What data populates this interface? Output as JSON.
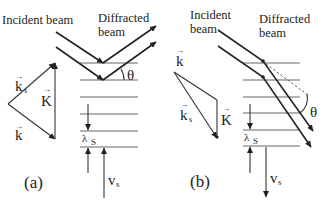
{
  "figure": {
    "panel_a": {
      "label": "(a)",
      "incident_beam_label": "Incident beam",
      "diffracted_beam_label_line1": "Diffracted",
      "diffracted_beam_label_line2": "beam",
      "angle_label": "θ",
      "vector_ks": "k",
      "vector_ks_sub": "s",
      "vector_K": "K",
      "vector_k": "k",
      "wavelength_label": "λ",
      "wavelength_sub": "S",
      "velocity_label": "v",
      "velocity_sub": "s",
      "velocity_direction": "up"
    },
    "panel_b": {
      "label": "(b)",
      "incident_beam_label_line1": "Incident",
      "incident_beam_label_line2": "beam",
      "diffracted_beam_label_line1": "Diffracted",
      "diffracted_beam_label_line2": "beam",
      "angle_label": "θ",
      "vector_k": "k",
      "vector_ks": "k",
      "vector_ks_sub": "s",
      "vector_K": "K",
      "wavelength_label": "λ",
      "wavelength_sub": "S",
      "velocity_label": "v",
      "velocity_sub": "s",
      "velocity_direction": "down"
    },
    "arrow_glyph": "→"
  }
}
